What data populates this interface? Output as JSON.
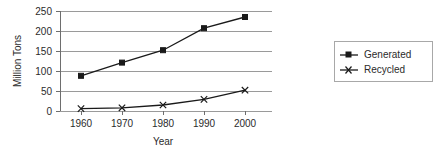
{
  "chart_data": {
    "type": "line",
    "title": "",
    "subtitle": "",
    "xlabel": "Year",
    "ylabel": "Million Tons",
    "categories": [
      "1960",
      "1970",
      "1980",
      "1990",
      "2000"
    ],
    "x": [
      1960,
      1970,
      1980,
      1990,
      2000
    ],
    "series": [
      {
        "name": "Generated",
        "marker": "square",
        "color": "#1a1a1a",
        "values": [
          88,
          121,
          152,
          207,
          235
        ]
      },
      {
        "name": "Recycled",
        "marker": "x-cross",
        "color": "#1a1a1a",
        "values": [
          6,
          8,
          15,
          29,
          52
        ]
      }
    ],
    "ylim": [
      0,
      250
    ],
    "yticks": [
      0,
      50,
      100,
      150,
      200,
      250
    ],
    "ytick_labels": [
      "0",
      "50",
      "100",
      "150",
      "200",
      "250"
    ],
    "xtick_labels": [
      "1960",
      "1970",
      "1980",
      "1990",
      "2000"
    ],
    "grid": "horizontal",
    "legend_position": "right",
    "legend_entries": [
      "Generated",
      "Recycled"
    ],
    "background_color": "#ffffff",
    "gridline_color": "#9a9a9a",
    "axis_color": "#6e6e6e"
  },
  "axes": {
    "y_title": "Million Tons",
    "x_title": "Year",
    "y_ticks": [
      "250",
      "200",
      "150",
      "100",
      "50",
      "0"
    ],
    "x_ticks": [
      "1960",
      "1970",
      "1980",
      "1990",
      "2000"
    ]
  },
  "legend": {
    "items": [
      {
        "label": "Generated",
        "marker": "square-marker"
      },
      {
        "label": "Recycled",
        "marker": "x-marker"
      }
    ]
  }
}
